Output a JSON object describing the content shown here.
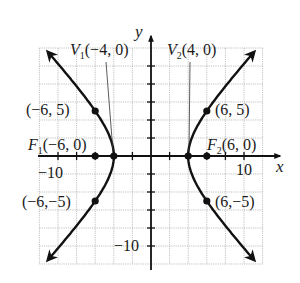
{
  "figure": {
    "type": "hyperbola",
    "equation_implied": "x^2/16 - y^2/20 = 1",
    "axes": {
      "x_label": "x",
      "y_label": "y",
      "x_tick_label": "10",
      "neg_x_tick_label": "−10",
      "neg_y_tick_label": "−10",
      "range": [
        -12,
        12
      ],
      "grid_step": 2,
      "tick_step": 2
    },
    "labels": {
      "v1": {
        "name": "V",
        "sub": "1",
        "coords": "(−4, 0)"
      },
      "v2": {
        "name": "V",
        "sub": "2",
        "coords": "(4, 0)"
      },
      "f1": {
        "name": "F",
        "sub": "1",
        "coords": "(−6, 0)"
      },
      "f2": {
        "name": "F",
        "sub": "2",
        "coords": "(6, 0)"
      },
      "p_ul": "(−6, 5)",
      "p_ur": "(6, 5)",
      "p_ll": "(−6,−5)",
      "p_lr": "(6,−5)"
    },
    "points": [
      {
        "x": -4,
        "y": 0,
        "label": "V1"
      },
      {
        "x": 4,
        "y": 0,
        "label": "V2"
      },
      {
        "x": -6,
        "y": 0,
        "label": "F1"
      },
      {
        "x": 6,
        "y": 0,
        "label": "F2"
      },
      {
        "x": -6,
        "y": 5
      },
      {
        "x": 6,
        "y": 5
      },
      {
        "x": -6,
        "y": -5
      },
      {
        "x": 6,
        "y": -5
      }
    ],
    "colors": {
      "curve": "#111111",
      "grid": "#a8a8a8",
      "background": "#ffffff"
    }
  }
}
